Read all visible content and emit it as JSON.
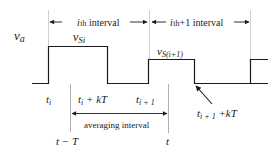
{
  "diagram": {
    "signal_label": "v",
    "signal_sub": "a",
    "intervals": [
      {
        "prefix": "i",
        "rest": "th interval"
      },
      {
        "prefix": "i",
        "rest": "th +1 interval"
      }
    ],
    "pulses": [
      {
        "label_main": "v",
        "label_sub": "Si"
      },
      {
        "label_main": "v",
        "label_sub": "S(i+1)"
      }
    ],
    "time_labels": {
      "ti": {
        "main": "t",
        "sub": "i"
      },
      "ti_kT": {
        "main": "t",
        "sub": "i",
        "suffix": " + kT"
      },
      "ti1": {
        "main": "t",
        "sub": "i + 1"
      },
      "ti1_kT": {
        "main": "t",
        "sub": "i + 1",
        "suffix": " +kT"
      },
      "t_minus_T": "t − T",
      "t": "t"
    },
    "averaging_label": "averaging interval",
    "colors": {
      "line": "#1a1a1a",
      "guide": "#bdbdbd"
    }
  }
}
